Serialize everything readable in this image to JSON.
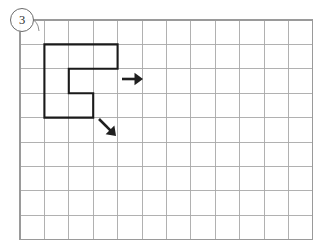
{
  "page": {
    "background_color": "#ffffff"
  },
  "problem_badge": {
    "label": "3",
    "shape": "circle",
    "text_color": "#2a2a2a",
    "border_color": "#6b6b6b"
  },
  "grid": {
    "columns": 12,
    "rows": 9,
    "cell_size": 24.4,
    "origin_x": 20,
    "origin_y": 20,
    "line_color": "#a8a8a8",
    "border_color": "#9a9a9a"
  },
  "figure": {
    "name": "c-shaped-polygon",
    "stroke_color": "#1a1a1a",
    "stroke_width": 2.1,
    "vertices_cells": [
      [
        1,
        1
      ],
      [
        4,
        1
      ],
      [
        4,
        2
      ],
      [
        2,
        2
      ],
      [
        2,
        3
      ],
      [
        3,
        3
      ],
      [
        3,
        4
      ],
      [
        1,
        4
      ]
    ]
  },
  "arrows": [
    {
      "name": "right-arrow",
      "direction": "right",
      "color": "#1f1f1f",
      "start": [
        122,
        79
      ],
      "end": [
        143,
        79
      ]
    },
    {
      "name": "diagonal-down-right-arrow",
      "direction": "down-right",
      "color": "#1f1f1f",
      "start": [
        99,
        119
      ],
      "end": [
        116,
        136
      ]
    }
  ]
}
